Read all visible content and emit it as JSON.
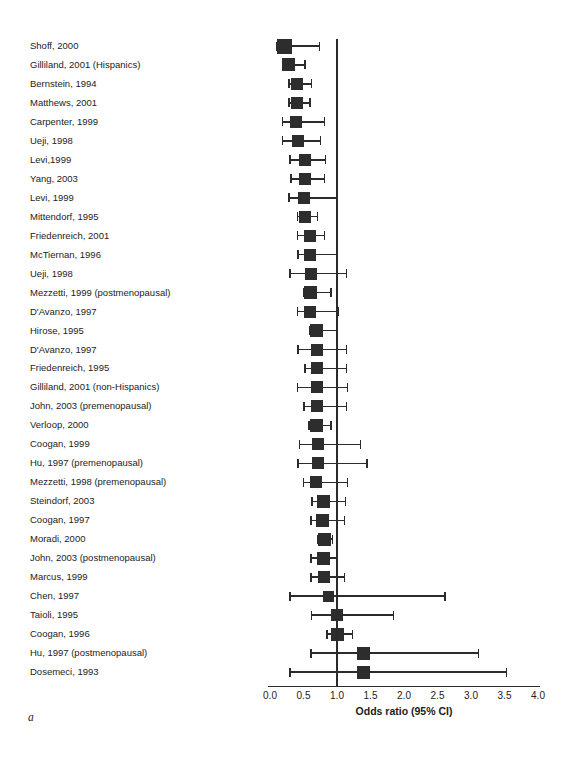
{
  "figure_label": "a",
  "colors": {
    "marker": "#2d2d2d",
    "line": "#2b2b2b",
    "text": "#1c1c1c",
    "background": "#ffffff"
  },
  "chart_data": {
    "type": "scatter",
    "subtype": "forest-plot-odds-ratios-with-95ci",
    "title": "",
    "xlabel": "Odds ratio (95% CI)",
    "ylabel": "",
    "xlim": [
      0.0,
      4.0
    ],
    "xticks": [
      0.0,
      0.5,
      1.0,
      1.5,
      2.0,
      2.5,
      3.0,
      3.5,
      4.0
    ],
    "xtick_labels": [
      "0.0",
      "0.5",
      "1.0",
      "1.5",
      "2.0",
      "2.5",
      "3.0",
      "3.5",
      "4.0"
    ],
    "reference_line_x": 1.0,
    "grid": false,
    "legend": "none",
    "studies": [
      {
        "label": "Shoff, 2000",
        "or": 0.21,
        "ci_low": 0.1,
        "ci_high": 0.74,
        "marker_px": 15
      },
      {
        "label": "Gilliland, 2001 (Hispanics)",
        "or": 0.28,
        "ci_low": 0.19,
        "ci_high": 0.52,
        "marker_px": 13
      },
      {
        "label": "Bernstein, 1994",
        "or": 0.4,
        "ci_low": 0.28,
        "ci_high": 0.62,
        "marker_px": 12
      },
      {
        "label": "Matthews, 2001",
        "or": 0.4,
        "ci_low": 0.28,
        "ci_high": 0.6,
        "marker_px": 12
      },
      {
        "label": "Carpenter, 1999",
        "or": 0.39,
        "ci_low": 0.19,
        "ci_high": 0.81,
        "marker_px": 12
      },
      {
        "label": "Ueji, 1998",
        "or": 0.42,
        "ci_low": 0.19,
        "ci_high": 0.75,
        "marker_px": 12
      },
      {
        "label": "Levi,1999",
        "or": 0.52,
        "ci_low": 0.3,
        "ci_high": 0.83,
        "marker_px": 12
      },
      {
        "label": "Yang, 2003",
        "or": 0.52,
        "ci_low": 0.31,
        "ci_high": 0.81,
        "marker_px": 12
      },
      {
        "label": "Levi, 1999",
        "or": 0.51,
        "ci_low": 0.28,
        "ci_high": 1.0,
        "marker_px": 12
      },
      {
        "label": "Mittendorf, 1995",
        "or": 0.52,
        "ci_low": 0.41,
        "ci_high": 0.71,
        "marker_px": 12
      },
      {
        "label": "Friedenreich, 2001",
        "or": 0.6,
        "ci_low": 0.41,
        "ci_high": 0.81,
        "marker_px": 12
      },
      {
        "label": "McTiernan, 1996",
        "or": 0.59,
        "ci_low": 0.42,
        "ci_high": 1.0,
        "marker_px": 12
      },
      {
        "label": "Ueji, 1998",
        "or": 0.61,
        "ci_low": 0.3,
        "ci_high": 1.14,
        "marker_px": 12
      },
      {
        "label": "Mezzetti, 1999 (postmenopausal)",
        "or": 0.61,
        "ci_low": 0.51,
        "ci_high": 0.91,
        "marker_px": 13
      },
      {
        "label": "D'Avanzo, 1997",
        "or": 0.6,
        "ci_low": 0.41,
        "ci_high": 1.02,
        "marker_px": 12
      },
      {
        "label": "Hirose, 1995",
        "or": 0.69,
        "ci_low": 0.6,
        "ci_high": 1.0,
        "marker_px": 13
      },
      {
        "label": "D'Avanzo, 1997",
        "or": 0.7,
        "ci_low": 0.42,
        "ci_high": 1.14,
        "marker_px": 12
      },
      {
        "label": "Friedenreich, 1995",
        "or": 0.7,
        "ci_low": 0.52,
        "ci_high": 1.14,
        "marker_px": 12
      },
      {
        "label": "Gilliland, 2001 (non-Hispanics)",
        "or": 0.7,
        "ci_low": 0.41,
        "ci_high": 1.16,
        "marker_px": 12
      },
      {
        "label": "John, 2003 (premenopausal)",
        "or": 0.7,
        "ci_low": 0.51,
        "ci_high": 1.14,
        "marker_px": 12
      },
      {
        "label": "Verloop, 2000",
        "or": 0.69,
        "ci_low": 0.58,
        "ci_high": 0.91,
        "marker_px": 13
      },
      {
        "label": "Coogan, 1999",
        "or": 0.71,
        "ci_low": 0.44,
        "ci_high": 1.35,
        "marker_px": 12
      },
      {
        "label": "Hu, 1997 (premenopausal)",
        "or": 0.71,
        "ci_low": 0.42,
        "ci_high": 1.45,
        "marker_px": 12
      },
      {
        "label": "Mezzetti, 1998 (premenopausal)",
        "or": 0.68,
        "ci_low": 0.5,
        "ci_high": 1.16,
        "marker_px": 12
      },
      {
        "label": "Steindorf, 2003",
        "or": 0.8,
        "ci_low": 0.63,
        "ci_high": 1.13,
        "marker_px": 13
      },
      {
        "label": "Coogan, 1997",
        "or": 0.78,
        "ci_low": 0.61,
        "ci_high": 1.11,
        "marker_px": 13
      },
      {
        "label": "Moradi, 2000",
        "or": 0.81,
        "ci_low": 0.72,
        "ci_high": 0.93,
        "marker_px": 13
      },
      {
        "label": "John, 2003 (postmenopausal)",
        "or": 0.8,
        "ci_low": 0.61,
        "ci_high": 1.01,
        "marker_px": 13
      },
      {
        "label": "Marcus, 1999",
        "or": 0.8,
        "ci_low": 0.61,
        "ci_high": 1.11,
        "marker_px": 12
      },
      {
        "label": "Chen, 1997",
        "or": 0.88,
        "ci_low": 0.3,
        "ci_high": 2.61,
        "marker_px": 11
      },
      {
        "label": "Taioli, 1995",
        "or": 1.0,
        "ci_low": 0.62,
        "ci_high": 1.84,
        "marker_px": 12
      },
      {
        "label": "Coogan, 1996",
        "or": 1.0,
        "ci_low": 0.85,
        "ci_high": 1.23,
        "marker_px": 13
      },
      {
        "label": "Hu, 1997 (postmenopausal)",
        "or": 1.39,
        "ci_low": 0.61,
        "ci_high": 3.11,
        "marker_px": 13
      },
      {
        "label": "Dosemeci, 1993",
        "or": 1.39,
        "ci_low": 0.3,
        "ci_high": 3.53,
        "marker_px": 13
      }
    ]
  }
}
